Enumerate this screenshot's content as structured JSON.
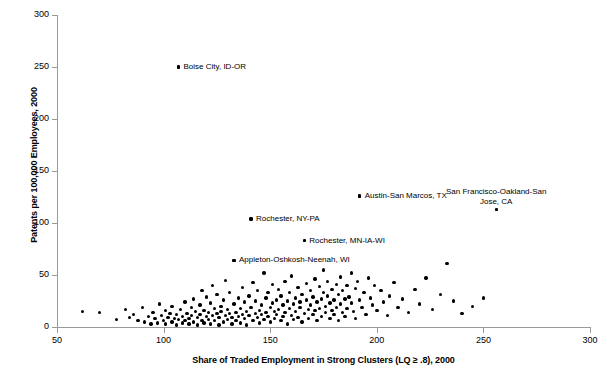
{
  "chart_data": {
    "type": "scatter",
    "title": "",
    "xlabel": "Share of Traded Employment in Strong Clusters (LQ ≥ .8), 2000",
    "ylabel": "Patents per 100,000 Employees, 2000",
    "xlim": [
      50,
      300
    ],
    "ylim": [
      0,
      300
    ],
    "xticks": [
      50,
      100,
      150,
      200,
      250,
      300
    ],
    "yticks": [
      0,
      50,
      100,
      150,
      200,
      250,
      300
    ],
    "grid": false,
    "legend": "none",
    "marker": "filled-circle-black",
    "annotations": [
      {
        "label": "Boise City, ID-OR",
        "x": 107,
        "y": 250,
        "align": "left"
      },
      {
        "label": "Rochester, NY-PA",
        "x": 141,
        "y": 104,
        "align": "left"
      },
      {
        "label": "Rochester, MN-IA-WI",
        "x": 166,
        "y": 83,
        "align": "left"
      },
      {
        "label": "Austin-San Marcos, TX",
        "x": 192,
        "y": 126,
        "align": "left"
      },
      {
        "label": "San Francisco-Oakland-San Jose, CA",
        "x": 256,
        "y": 113,
        "align": "center"
      },
      {
        "label": "Appleton-Oshkosh-Neenah, WI",
        "x": 133,
        "y": 64,
        "align": "left"
      }
    ],
    "points": [
      [
        62,
        15
      ],
      [
        70,
        14
      ],
      [
        78,
        7
      ],
      [
        82,
        17
      ],
      [
        84,
        9
      ],
      [
        86,
        12
      ],
      [
        88,
        6
      ],
      [
        90,
        19
      ],
      [
        91,
        5
      ],
      [
        93,
        10
      ],
      [
        94,
        3
      ],
      [
        95,
        14
      ],
      [
        96,
        8
      ],
      [
        97,
        4
      ],
      [
        98,
        22
      ],
      [
        99,
        11
      ],
      [
        100,
        6
      ],
      [
        101,
        16
      ],
      [
        101,
        3
      ],
      [
        102,
        9
      ],
      [
        103,
        13
      ],
      [
        104,
        5
      ],
      [
        104,
        20
      ],
      [
        105,
        8
      ],
      [
        106,
        2
      ],
      [
        106,
        12
      ],
      [
        107,
        7
      ],
      [
        107,
        250
      ],
      [
        108,
        17
      ],
      [
        109,
        4
      ],
      [
        109,
        10
      ],
      [
        110,
        24
      ],
      [
        110,
        6
      ],
      [
        111,
        13
      ],
      [
        112,
        8
      ],
      [
        112,
        3
      ],
      [
        113,
        19
      ],
      [
        113,
        11
      ],
      [
        114,
        5
      ],
      [
        114,
        27
      ],
      [
        115,
        15
      ],
      [
        116,
        9
      ],
      [
        116,
        2
      ],
      [
        117,
        21
      ],
      [
        117,
        12
      ],
      [
        118,
        6
      ],
      [
        118,
        35
      ],
      [
        119,
        16
      ],
      [
        119,
        4
      ],
      [
        120,
        10
      ],
      [
        120,
        29
      ],
      [
        121,
        14
      ],
      [
        121,
        7
      ],
      [
        122,
        23
      ],
      [
        122,
        3
      ],
      [
        123,
        11
      ],
      [
        123,
        40
      ],
      [
        124,
        18
      ],
      [
        124,
        6
      ],
      [
        125,
        13
      ],
      [
        125,
        31
      ],
      [
        126,
        9
      ],
      [
        126,
        2
      ],
      [
        127,
        20
      ],
      [
        127,
        15
      ],
      [
        128,
        5
      ],
      [
        128,
        26
      ],
      [
        129,
        11
      ],
      [
        129,
        45
      ],
      [
        130,
        17
      ],
      [
        130,
        7
      ],
      [
        131,
        13
      ],
      [
        131,
        33
      ],
      [
        132,
        9
      ],
      [
        132,
        3
      ],
      [
        133,
        22
      ],
      [
        133,
        64
      ],
      [
        134,
        14
      ],
      [
        134,
        6
      ],
      [
        135,
        28
      ],
      [
        135,
        10
      ],
      [
        136,
        18
      ],
      [
        136,
        4
      ],
      [
        137,
        12
      ],
      [
        137,
        38
      ],
      [
        138,
        8
      ],
      [
        138,
        24
      ],
      [
        139,
        15
      ],
      [
        139,
        2
      ],
      [
        140,
        30
      ],
      [
        140,
        11
      ],
      [
        141,
        19
      ],
      [
        141,
        104
      ],
      [
        142,
        6
      ],
      [
        142,
        43
      ],
      [
        143,
        13
      ],
      [
        143,
        25
      ],
      [
        144,
        9
      ],
      [
        144,
        35
      ],
      [
        145,
        16
      ],
      [
        145,
        4
      ],
      [
        146,
        21
      ],
      [
        146,
        12
      ],
      [
        147,
        7
      ],
      [
        147,
        52
      ],
      [
        148,
        28
      ],
      [
        148,
        14
      ],
      [
        149,
        10
      ],
      [
        149,
        33
      ],
      [
        150,
        19
      ],
      [
        150,
        5
      ],
      [
        151,
        23
      ],
      [
        151,
        41
      ],
      [
        152,
        15
      ],
      [
        152,
        8
      ],
      [
        153,
        26
      ],
      [
        153,
        12
      ],
      [
        154,
        36
      ],
      [
        154,
        17
      ],
      [
        155,
        6
      ],
      [
        155,
        30
      ],
      [
        156,
        21
      ],
      [
        156,
        10
      ],
      [
        157,
        44
      ],
      [
        157,
        14
      ],
      [
        158,
        25
      ],
      [
        158,
        3
      ],
      [
        159,
        18
      ],
      [
        159,
        33
      ],
      [
        160,
        11
      ],
      [
        160,
        49
      ],
      [
        161,
        22
      ],
      [
        161,
        7
      ],
      [
        162,
        28
      ],
      [
        162,
        15
      ],
      [
        163,
        38
      ],
      [
        163,
        9
      ],
      [
        164,
        24
      ],
      [
        164,
        19
      ],
      [
        165,
        31
      ],
      [
        165,
        5
      ],
      [
        166,
        13
      ],
      [
        166,
        83
      ],
      [
        167,
        26
      ],
      [
        167,
        42
      ],
      [
        168,
        17
      ],
      [
        168,
        8
      ],
      [
        169,
        35
      ],
      [
        169,
        21
      ],
      [
        170,
        12
      ],
      [
        170,
        29
      ],
      [
        171,
        46
      ],
      [
        171,
        16
      ],
      [
        172,
        24
      ],
      [
        172,
        6
      ],
      [
        173,
        39
      ],
      [
        173,
        18
      ],
      [
        174,
        27
      ],
      [
        174,
        10
      ],
      [
        175,
        33
      ],
      [
        175,
        55
      ],
      [
        176,
        20
      ],
      [
        176,
        14
      ],
      [
        177,
        30
      ],
      [
        177,
        44
      ],
      [
        178,
        23
      ],
      [
        178,
        8
      ],
      [
        179,
        36
      ],
      [
        179,
        16
      ],
      [
        180,
        26
      ],
      [
        180,
        12
      ],
      [
        181,
        41
      ],
      [
        181,
        19
      ],
      [
        182,
        31
      ],
      [
        182,
        6
      ],
      [
        183,
        48
      ],
      [
        183,
        22
      ],
      [
        184,
        14
      ],
      [
        184,
        35
      ],
      [
        185,
        27
      ],
      [
        185,
        10
      ],
      [
        186,
        40
      ],
      [
        186,
        18
      ],
      [
        187,
        29
      ],
      [
        188,
        52
      ],
      [
        188,
        23
      ],
      [
        189,
        15
      ],
      [
        190,
        37
      ],
      [
        190,
        8
      ],
      [
        191,
        44
      ],
      [
        192,
        26
      ],
      [
        192,
        126
      ],
      [
        193,
        19
      ],
      [
        194,
        33
      ],
      [
        195,
        12
      ],
      [
        196,
        47
      ],
      [
        197,
        28
      ],
      [
        198,
        21
      ],
      [
        199,
        40
      ],
      [
        200,
        16
      ],
      [
        202,
        35
      ],
      [
        203,
        24
      ],
      [
        205,
        11
      ],
      [
        206,
        30
      ],
      [
        208,
        43
      ],
      [
        210,
        19
      ],
      [
        212,
        27
      ],
      [
        215,
        14
      ],
      [
        218,
        36
      ],
      [
        220,
        22
      ],
      [
        223,
        47
      ],
      [
        226,
        17
      ],
      [
        230,
        31
      ],
      [
        233,
        61
      ],
      [
        236,
        25
      ],
      [
        240,
        13
      ],
      [
        245,
        20
      ],
      [
        250,
        28
      ],
      [
        256,
        113
      ]
    ]
  }
}
